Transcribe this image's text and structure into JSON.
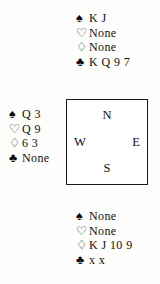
{
  "diagram": {
    "type": "bridge-hand-diagram",
    "suit_glyphs": {
      "spades": "♠",
      "hearts": "♡",
      "diamonds": "♢",
      "clubs": "♣"
    },
    "suit_order": [
      "spades",
      "hearts",
      "diamonds",
      "clubs"
    ],
    "compass": {
      "north": "N",
      "west": "W",
      "east": "E",
      "south": "S"
    },
    "hands": {
      "north": {
        "position_label": "N",
        "spades": "K J",
        "hearts": "None",
        "diamonds": "None",
        "clubs": "K Q 9 7"
      },
      "west": {
        "position_label": "W",
        "spades": "Q 3",
        "hearts": "Q 9",
        "diamonds": "6 3",
        "clubs": "None"
      },
      "south": {
        "position_label": "S",
        "spades": "None",
        "hearts": "None",
        "diamonds": "K J 10 9",
        "clubs": "x x"
      }
    },
    "colors": {
      "ink": "#111111",
      "page_background": "#fdfdfc",
      "box_border": "#1a1a1a",
      "box_fill": "#ffffff"
    }
  }
}
